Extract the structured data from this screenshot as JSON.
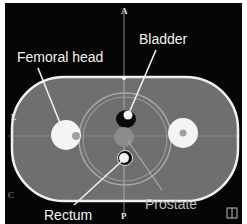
{
  "image": {
    "description": "Axial CT phantom slice of pelvis with labeled structures",
    "colors": {
      "background": "#050505",
      "body_fill": "#6f6f6f",
      "outline": "#f0f0f0",
      "bone": "#f4f4f4",
      "prostate": "#8c8c8c",
      "label_text": "#f2f2f2"
    }
  },
  "orientation": {
    "anterior": "A",
    "posterior": "P",
    "left": "L",
    "corner_left": "C",
    "corner_right_icon": "book-icon"
  },
  "labels": {
    "femoral_head": "Femoral head",
    "bladder": "Bladder",
    "rectum": "Rectum",
    "prostate": "Prostate"
  }
}
